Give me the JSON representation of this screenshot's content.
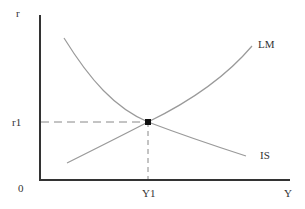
{
  "diagram": {
    "type": "IS-LM",
    "axes": {
      "y_label": "r",
      "x_label": "Y",
      "origin_label": "0",
      "axis_color": "#333333"
    },
    "equilibrium": {
      "r_label": "r1",
      "y_label": "Y1",
      "marker_color": "#111111"
    },
    "curves": [
      {
        "name": "LM",
        "label": "LM",
        "slope": "upward",
        "color": "#9a9a9a"
      },
      {
        "name": "IS",
        "label": "IS",
        "slope": "downward",
        "color": "#9a9a9a"
      }
    ],
    "guide_line_style": "dashed"
  }
}
